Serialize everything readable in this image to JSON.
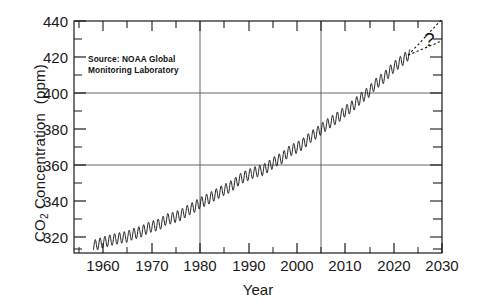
{
  "chart_data": {
    "type": "line",
    "title": "",
    "xlabel": "Year",
    "ylabel": "CO2 Concentration (ppm)",
    "ylabel_parts": {
      "prefix": "CO",
      "sub": "2",
      "suffix": " Concentration  (ppm)"
    },
    "xlim": [
      1954,
      2030
    ],
    "ylim": [
      311,
      440
    ],
    "ytick_labels": [
      "320",
      "340",
      "360",
      "380",
      "400",
      "420",
      "440"
    ],
    "ytick_values": [
      320,
      340,
      360,
      380,
      400,
      420,
      440
    ],
    "yminor_step": 10,
    "xtick_labels": [
      "1960",
      "1970",
      "1980",
      "1990",
      "2000",
      "2010",
      "2020",
      "2030"
    ],
    "xtick_values": [
      1960,
      1970,
      1980,
      1990,
      2000,
      2010,
      2020,
      2030
    ],
    "xminor_step": 5,
    "grid": {
      "horizontal_at": [
        360,
        400
      ],
      "vertical_at": [
        1980,
        2005
      ]
    },
    "legend": null,
    "annotations": [
      {
        "name": "source-note",
        "text": "Source:  NOAA Global\nMonitoring Laboratory",
        "x": 1957.5,
        "y": 422
      },
      {
        "name": "question-mark",
        "text": "?",
        "x": 2026.5,
        "y": 427
      }
    ],
    "series": [
      {
        "name": "Mauna Loa monthly mean CO2",
        "style": "solid",
        "note": "Keeling curve: annual mean trend plus ~6 ppm peak-to-peak seasonal cycle",
        "x": [
          1958,
          1959,
          1960,
          1961,
          1962,
          1963,
          1964,
          1965,
          1966,
          1967,
          1968,
          1969,
          1970,
          1971,
          1972,
          1973,
          1974,
          1975,
          1976,
          1977,
          1978,
          1979,
          1980,
          1981,
          1982,
          1983,
          1984,
          1985,
          1986,
          1987,
          1988,
          1989,
          1990,
          1991,
          1992,
          1993,
          1994,
          1995,
          1996,
          1997,
          1998,
          1999,
          2000,
          2001,
          2002,
          2003,
          2004,
          2005,
          2006,
          2007,
          2008,
          2009,
          2010,
          2011,
          2012,
          2013,
          2014,
          2015,
          2016,
          2017,
          2018,
          2019,
          2020,
          2021,
          2022,
          2023
        ],
        "y": [
          315.0,
          315.97,
          316.91,
          317.64,
          318.45,
          318.99,
          319.62,
          320.04,
          321.38,
          322.16,
          323.04,
          324.62,
          325.68,
          326.32,
          327.45,
          329.68,
          330.18,
          331.11,
          332.04,
          333.83,
          335.4,
          336.84,
          338.75,
          340.11,
          341.45,
          343.05,
          344.65,
          346.12,
          347.42,
          349.19,
          351.57,
          353.12,
          354.39,
          355.61,
          356.45,
          357.1,
          358.83,
          360.82,
          362.61,
          363.73,
          366.7,
          368.38,
          369.55,
          371.14,
          373.28,
          375.8,
          377.52,
          379.8,
          381.9,
          383.79,
          385.6,
          387.43,
          389.9,
          391.65,
          393.85,
          396.52,
          398.65,
          400.83,
          404.24,
          406.55,
          408.52,
          411.44,
          414.24,
          416.45,
          418.56,
          421.08
        ]
      },
      {
        "name": "high projection",
        "style": "dashed",
        "x": [
          2023,
          2030
        ],
        "y": [
          421,
          441
        ]
      },
      {
        "name": "low projection",
        "style": "dashed",
        "x": [
          2023,
          2030
        ],
        "y": [
          421,
          429
        ]
      }
    ]
  },
  "axis": {
    "frame_color": "#1a1a1a",
    "grid_color": "#555555",
    "line_color": "#111111"
  }
}
